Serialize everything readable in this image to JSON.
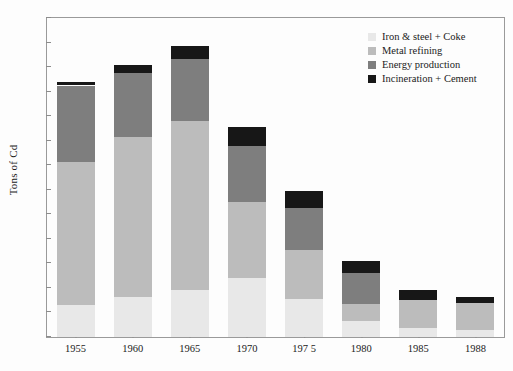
{
  "chart_data": {
    "type": "bar",
    "subtype": "stacked-bar",
    "title": "",
    "xlabel": "",
    "ylabel": "Tons of Cd",
    "categories": [
      "1955",
      "1960",
      "1965",
      "1970",
      "197 5",
      "1980",
      "1985",
      "1988"
    ],
    "ylim": [
      0,
      260
    ],
    "yticks": [
      0,
      20,
      40,
      60,
      80,
      100,
      120,
      140,
      160,
      180,
      200,
      220,
      240,
      260
    ],
    "grid": false,
    "legend_position": "top-right",
    "series": [
      {
        "name": "Iron & steel + Coke",
        "color": "#e8e8e8",
        "values": [
          26,
          33,
          38,
          48,
          31,
          13,
          7,
          6
        ]
      },
      {
        "name": "Metal refining",
        "color": "#bcbcbc",
        "values": [
          117,
          130,
          138,
          62,
          40,
          14,
          23,
          22
        ]
      },
      {
        "name": "Energy production",
        "color": "#7e7e7e",
        "values": [
          62,
          52,
          51,
          46,
          34,
          25,
          0,
          0
        ]
      },
      {
        "name": "Incineration + Cement",
        "color": "#171717",
        "values": [
          3,
          7,
          10,
          15,
          14,
          10,
          8,
          5
        ]
      }
    ],
    "totals": [
      208,
      222,
      237,
      171,
      119,
      62,
      38,
      33
    ]
  },
  "legend": {
    "items": [
      {
        "label": "Iron & steel + Coke",
        "color": "#e8e8e8"
      },
      {
        "label": "Metal refining",
        "color": "#bcbcbc"
      },
      {
        "label": "Energy production",
        "color": "#7e7e7e"
      },
      {
        "label": "Incineration + Cement",
        "color": "#171717"
      }
    ]
  }
}
